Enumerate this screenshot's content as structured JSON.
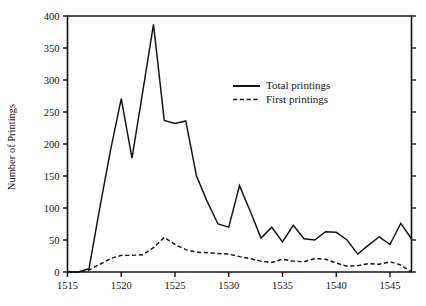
{
  "chart_data": {
    "type": "line",
    "title": "",
    "xlabel": "",
    "ylabel": "Number of Printings",
    "xlim": [
      1515,
      1547
    ],
    "ylim": [
      0,
      400
    ],
    "ytick_step": 50,
    "xtick_step": 5,
    "grid": false,
    "legend_position": "upper-center-right",
    "yticks": [
      0,
      50,
      100,
      150,
      200,
      250,
      300,
      350,
      400
    ],
    "ytick_labels": [
      "0",
      "50",
      "100",
      "150",
      "200",
      "250",
      "300",
      "350",
      "400"
    ],
    "xticks": [
      1515,
      1520,
      1525,
      1530,
      1535,
      1540,
      1545
    ],
    "xtick_labels": [
      "1515",
      "1520",
      "1525",
      "1530",
      "1535",
      "1540",
      "1545"
    ],
    "x": [
      1515,
      1516,
      1517,
      1518,
      1519,
      1520,
      1521,
      1522,
      1523,
      1524,
      1525,
      1526,
      1527,
      1528,
      1529,
      1530,
      1531,
      1532,
      1533,
      1534,
      1535,
      1536,
      1537,
      1538,
      1539,
      1540,
      1541,
      1542,
      1543,
      1544,
      1545,
      1546,
      1547
    ],
    "series": [
      {
        "name": "Total printings",
        "style": "solid",
        "values": [
          0,
          0,
          5,
          100,
          190,
          271,
          178,
          282,
          387,
          237,
          232,
          236,
          150,
          110,
          75,
          70,
          135,
          95,
          53,
          70,
          47,
          73,
          52,
          50,
          63,
          62,
          50,
          28,
          42,
          55,
          43,
          76,
          52
        ]
      },
      {
        "name": "First printings",
        "style": "dashed",
        "values": [
          0,
          0,
          3,
          12,
          21,
          26,
          26,
          27,
          38,
          54,
          43,
          35,
          31,
          30,
          29,
          28,
          24,
          21,
          17,
          15,
          20,
          17,
          16,
          21,
          20,
          14,
          9,
          10,
          13,
          12,
          16,
          11,
          0
        ]
      }
    ]
  },
  "legend": {
    "entries": [
      {
        "label": "Total printings",
        "style": "solid"
      },
      {
        "label": "First printings",
        "style": "dashed"
      }
    ]
  },
  "axes": {
    "y_title": "Number of Printings"
  }
}
